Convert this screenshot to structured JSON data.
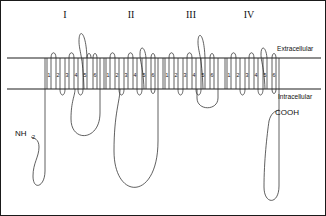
{
  "figure": {
    "membrane": {
      "extracellular_label": "Extracellular",
      "intracellular_label": "Intracellular",
      "top_y": 57,
      "bottom_y": 88,
      "line_color": "#1f1f1f",
      "fill_color": "#ffffff"
    },
    "termini": [
      {
        "name": "n-terminus",
        "label": "NH",
        "subscript": "2",
        "x": 18,
        "y": 133
      },
      {
        "name": "c-terminus",
        "label": "COOH",
        "subscript": "",
        "x": 276,
        "y": 113
      }
    ],
    "domains": [
      {
        "id": "I",
        "label": "I",
        "label_x": 64,
        "label_y": 17,
        "x_start": 44,
        "segments": [
          "1",
          "2",
          "3",
          "4",
          "5",
          "6"
        ],
        "pore_loop_after_segment": "5",
        "pore_loop_height": 30
      },
      {
        "id": "II",
        "label": "II",
        "label_x": 122,
        "label_y": 17,
        "x_start": 103,
        "segments": [
          "1",
          "2",
          "3",
          "4",
          "5",
          "6"
        ],
        "pore_loop_after_segment": "5",
        "pore_loop_height": 14
      },
      {
        "id": "III",
        "label": "III",
        "label_x": 184,
        "label_y": 17,
        "x_start": 162,
        "segments": [
          "1",
          "2",
          "3",
          "4",
          "5",
          "6"
        ],
        "pore_loop_after_segment": "5",
        "pore_loop_height": 27
      },
      {
        "id": "IV",
        "label": "IV",
        "label_x": 244,
        "label_y": 17,
        "x_start": 224,
        "segments": [
          "1",
          "2",
          "3",
          "4",
          "5",
          "6"
        ],
        "pore_loop_after_segment": "5",
        "pore_loop_height": 14
      }
    ],
    "linkers": [
      {
        "name": "linker-I-II",
        "depth": 130
      },
      {
        "name": "linker-II-III",
        "depth": 196
      },
      {
        "name": "linker-III-IV",
        "depth": 106
      }
    ],
    "colors": {
      "ink": "#2b2b2b",
      "membrane": "#1f1f1f",
      "background": "#ffffff",
      "border": "#1a1a1a"
    }
  }
}
